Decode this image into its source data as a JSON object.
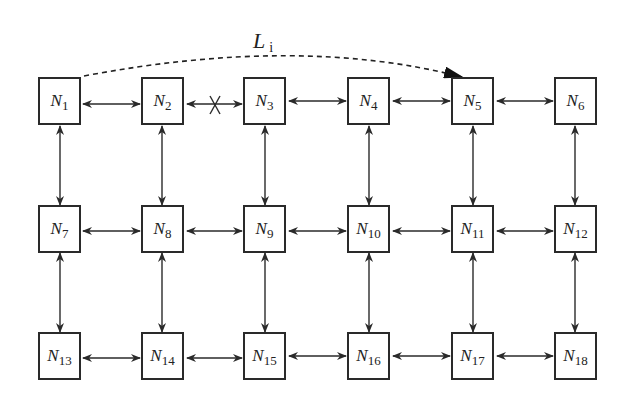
{
  "diagram": {
    "path_label": {
      "main": "L",
      "sub": "i"
    },
    "nodes": [
      {
        "id": "N1",
        "main": "N",
        "sub": "1",
        "row": 0,
        "col": 0
      },
      {
        "id": "N2",
        "main": "N",
        "sub": "2",
        "row": 0,
        "col": 1
      },
      {
        "id": "N3",
        "main": "N",
        "sub": "3",
        "row": 0,
        "col": 2
      },
      {
        "id": "N4",
        "main": "N",
        "sub": "4",
        "row": 0,
        "col": 3
      },
      {
        "id": "N5",
        "main": "N",
        "sub": "5",
        "row": 0,
        "col": 4
      },
      {
        "id": "N6",
        "main": "N",
        "sub": "6",
        "row": 0,
        "col": 5
      },
      {
        "id": "N7",
        "main": "N",
        "sub": "7",
        "row": 1,
        "col": 0
      },
      {
        "id": "N8",
        "main": "N",
        "sub": "8",
        "row": 1,
        "col": 1
      },
      {
        "id": "N9",
        "main": "N",
        "sub": "9",
        "row": 1,
        "col": 2
      },
      {
        "id": "N10",
        "main": "N",
        "sub": "10",
        "row": 1,
        "col": 3
      },
      {
        "id": "N11",
        "main": "N",
        "sub": "11",
        "row": 1,
        "col": 4
      },
      {
        "id": "N12",
        "main": "N",
        "sub": "12",
        "row": 1,
        "col": 5
      },
      {
        "id": "N13",
        "main": "N",
        "sub": "13",
        "row": 2,
        "col": 0
      },
      {
        "id": "N14",
        "main": "N",
        "sub": "14",
        "row": 2,
        "col": 1
      },
      {
        "id": "N15",
        "main": "N",
        "sub": "15",
        "row": 2,
        "col": 2
      },
      {
        "id": "N16",
        "main": "N",
        "sub": "16",
        "row": 2,
        "col": 3
      },
      {
        "id": "N17",
        "main": "N",
        "sub": "17",
        "row": 2,
        "col": 4
      },
      {
        "id": "N18",
        "main": "N",
        "sub": "18",
        "row": 2,
        "col": 5
      }
    ],
    "broken_link": {
      "from": "N2",
      "to": "N3",
      "marker": "X"
    },
    "dashed_path": {
      "from": "N1",
      "to": "N5",
      "label": "L_i"
    },
    "colors": {
      "stroke": "#2a2a2a",
      "background": "#ffffff"
    }
  }
}
